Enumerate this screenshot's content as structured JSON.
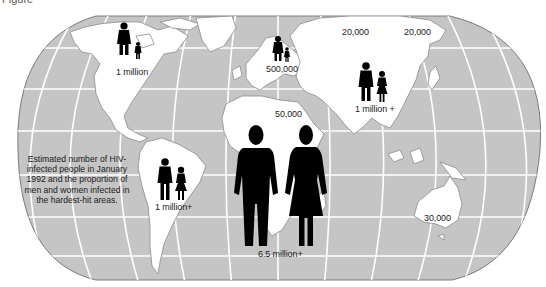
{
  "figure": {
    "label": "Figure",
    "caption": "Estimated number of HIV-infected people in January 1992 and the proportion of men and women infected in the hardest-hit areas.",
    "colors": {
      "ocean": "#c5c5c5",
      "land": "#ffffff",
      "coast": "#8a8a8a",
      "graticule": "#ffffff",
      "figures": "#000000"
    }
  },
  "regions": [
    {
      "id": "north-america",
      "name": "North America",
      "value": "1 million",
      "icons": "man-and-child"
    },
    {
      "id": "europe",
      "name": "Europe",
      "value": "500,000",
      "icons": "man-and-child"
    },
    {
      "id": "eastern-europe-russia",
      "name": "Eastern Europe / Central Asia",
      "value": "20,000"
    },
    {
      "id": "east-asia",
      "name": "East Asia",
      "value": "20,000"
    },
    {
      "id": "south-southeast-asia",
      "name": "South and Southeast Asia",
      "value": "1 million +",
      "icons": "man-and-woman"
    },
    {
      "id": "north-africa-middle-east",
      "name": "North Africa / Middle East",
      "value": "50,000"
    },
    {
      "id": "latin-america",
      "name": "Latin America",
      "value": "1 million+",
      "icons": "man-and-woman"
    },
    {
      "id": "sub-saharan-africa",
      "name": "Sub-Saharan Africa",
      "value": "6.5 million+",
      "icons": "man-and-woman-large"
    },
    {
      "id": "australia",
      "name": "Australia",
      "value": "30,000"
    }
  ]
}
